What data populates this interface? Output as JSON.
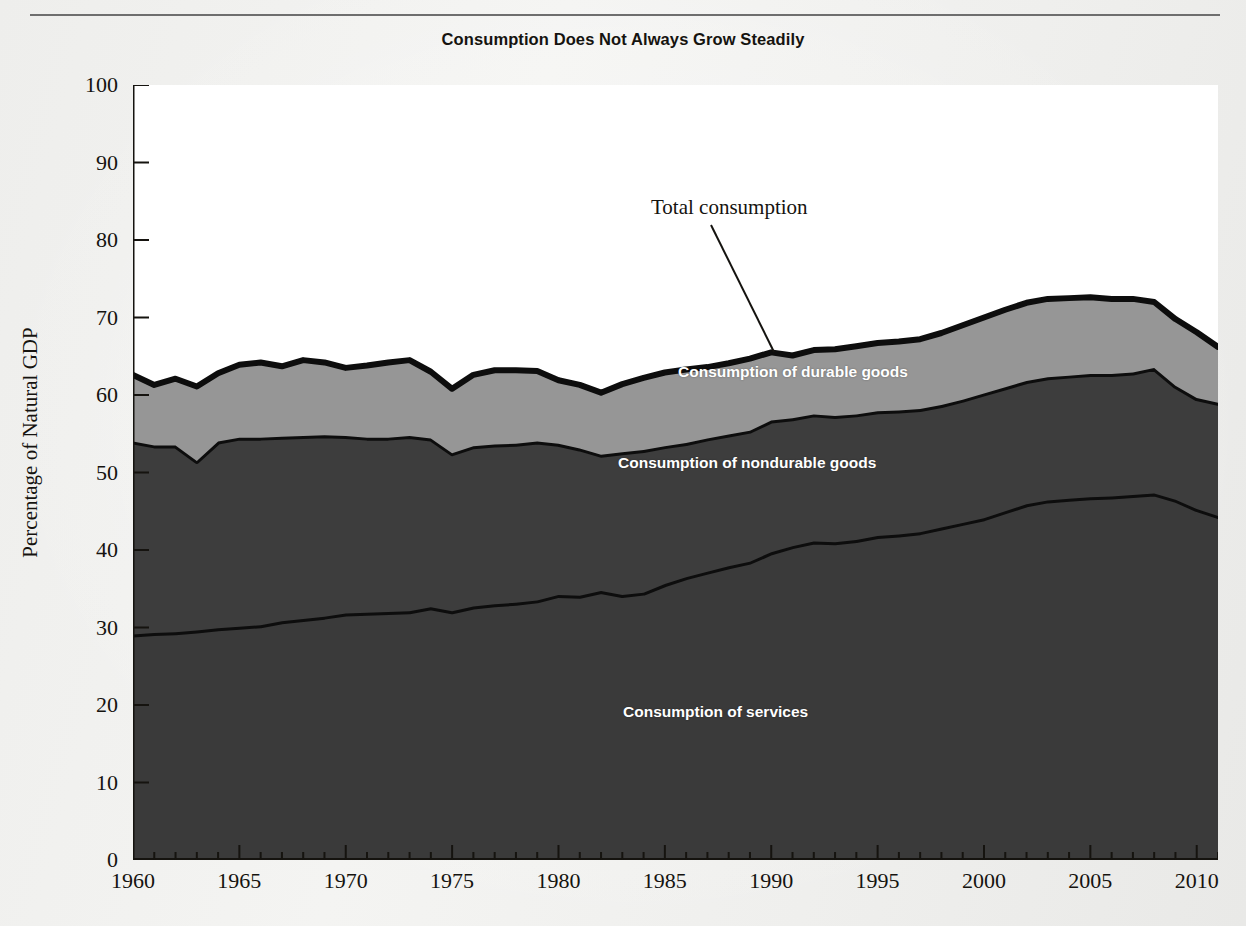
{
  "chart_data": {
    "type": "area",
    "stacked": true,
    "title": "Consumption Does Not Always Grow Steadily",
    "xlabel": "",
    "ylabel": "Percentage of Natural GDP",
    "ylim": [
      0,
      100
    ],
    "xlim": [
      1960,
      2011
    ],
    "y_ticks": [
      0,
      10,
      20,
      30,
      40,
      50,
      60,
      70,
      80,
      90,
      100
    ],
    "x_ticks": [
      1960,
      1965,
      1970,
      1975,
      1980,
      1985,
      1990,
      1995,
      2000,
      2005,
      2010
    ],
    "x_minor_tick_step": 1,
    "grid": false,
    "legend": "in-plot labels",
    "annotations": [
      {
        "text": "Total consumption",
        "points_to_year": 1990,
        "points_to_value": 67.0
      }
    ],
    "x": [
      1960,
      1961,
      1962,
      1963,
      1964,
      1965,
      1966,
      1967,
      1968,
      1969,
      1970,
      1971,
      1972,
      1973,
      1974,
      1975,
      1976,
      1977,
      1978,
      1979,
      1980,
      1981,
      1982,
      1983,
      1984,
      1985,
      1986,
      1987,
      1988,
      1989,
      1990,
      1991,
      1992,
      1993,
      1994,
      1995,
      1996,
      1997,
      1998,
      1999,
      2000,
      2001,
      2002,
      2003,
      2004,
      2005,
      2006,
      2007,
      2008,
      2009,
      2010,
      2011
    ],
    "series": [
      {
        "name": "Consumption of services",
        "color": "#3a3a3a",
        "values": [
          29.1,
          29.3,
          29.4,
          29.6,
          29.9,
          30.1,
          30.3,
          30.8,
          31.1,
          31.4,
          31.8,
          31.9,
          32.0,
          32.1,
          32.6,
          32.1,
          32.7,
          33.0,
          33.2,
          33.5,
          34.2,
          34.1,
          34.7,
          34.2,
          34.5,
          35.6,
          36.5,
          37.2,
          37.9,
          38.5,
          39.7,
          40.5,
          41.1,
          41.0,
          41.3,
          41.8,
          42.0,
          42.3,
          42.9,
          43.5,
          44.1,
          45.0,
          45.9,
          46.4,
          46.6,
          46.8,
          46.9,
          47.1,
          47.3,
          46.5,
          45.3,
          44.4
        ]
      },
      {
        "name": "Consumption of nondurable goods",
        "color": "#3d3d3d",
        "values": [
          24.9,
          24.2,
          24.1,
          21.9,
          24.1,
          24.4,
          24.2,
          23.8,
          23.6,
          23.4,
          22.9,
          22.6,
          22.5,
          22.6,
          21.8,
          20.4,
          20.7,
          20.6,
          20.5,
          20.5,
          19.5,
          19.0,
          17.6,
          18.4,
          18.4,
          17.8,
          17.3,
          17.2,
          17.0,
          16.9,
          17.0,
          16.5,
          16.4,
          16.3,
          16.2,
          16.1,
          16.0,
          15.9,
          15.8,
          15.9,
          16.1,
          16.0,
          15.9,
          15.9,
          15.9,
          15.9,
          15.8,
          15.8,
          16.2,
          14.7,
          14.3,
          14.6
        ]
      },
      {
        "name": "Consumption of durable goods",
        "color": "#969696",
        "values": [
          8.6,
          7.8,
          8.6,
          9.6,
          8.8,
          9.4,
          9.7,
          9.1,
          9.8,
          9.4,
          8.8,
          9.3,
          9.7,
          9.8,
          8.6,
          8.3,
          9.2,
          9.6,
          9.5,
          9.1,
          8.2,
          8.2,
          8.0,
          8.8,
          9.3,
          9.5,
          9.5,
          9.2,
          9.2,
          9.3,
          8.8,
          8.1,
          8.3,
          8.6,
          8.8,
          8.8,
          8.9,
          9.0,
          9.3,
          9.6,
          9.8,
          10.0,
          10.1,
          10.1,
          10.0,
          9.9,
          9.7,
          9.5,
          8.5,
          8.6,
          8.5,
          7.2
        ]
      }
    ],
    "totals": [
      62.6,
      61.3,
      62.1,
      61.1,
      62.8,
      63.9,
      64.2,
      63.7,
      64.5,
      64.2,
      63.5,
      63.8,
      64.2,
      64.5,
      63.0,
      60.8,
      62.6,
      63.2,
      63.2,
      63.1,
      61.9,
      61.3,
      61.3,
      61.4,
      62.2,
      62.9,
      63.3,
      63.6,
      64.1,
      64.7,
      65.5,
      65.1,
      65.8,
      65.9,
      66.3,
      66.7,
      66.9,
      67.2,
      68.0,
      69.0,
      70.0,
      71.0,
      71.9,
      72.4,
      72.5,
      72.6,
      72.4,
      72.4,
      72.0,
      69.9,
      68.1,
      66.2
    ]
  },
  "header": {
    "title": "Consumption Does Not Always Grow Steadily"
  },
  "axes": {
    "y_title": "Percentage of Natural GDP",
    "y_ticks": [
      "100",
      "90",
      "80",
      "70",
      "60",
      "50",
      "40",
      "30",
      "20",
      "10",
      "0"
    ],
    "x_ticks": [
      "1960",
      "1965",
      "1970",
      "1975",
      "1980",
      "1985",
      "1990",
      "1995",
      "2000",
      "2005",
      "2010"
    ]
  },
  "labels": {
    "total_consumption": "Total consumption",
    "durable_goods": "Consumption of durable goods",
    "nondurable_goods": "Consumption of nondurable goods",
    "services": "Consumption of services"
  },
  "colors": {
    "durable": "#969696",
    "nondurable": "#3d3d3d",
    "services": "#3a3a3a",
    "outline": "#0d0d0d",
    "page": "#f2f2f0",
    "text": "#15130f"
  }
}
